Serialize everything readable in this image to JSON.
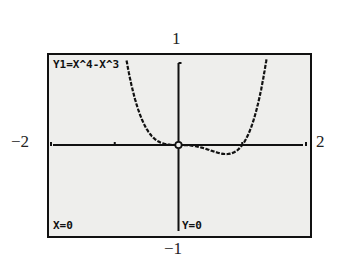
{
  "screen": {
    "equation_label": "Y1=X^4-X^3",
    "trace_x_label": "X=0",
    "trace_y_label": "Y=0"
  },
  "window": {
    "xmin_label": "−2",
    "xmax_label": "2",
    "ymin_label": "−1",
    "ymax_label": "1"
  },
  "colors": {
    "screen_bg": "#eeeeec",
    "ink": "#111111"
  },
  "chart_data": {
    "type": "line",
    "title": "Y1=X^4-X^3",
    "function": "x^4 - x^3",
    "xlabel": "",
    "ylabel": "",
    "xlim": [
      -2,
      2
    ],
    "ylim": [
      -1,
      1
    ],
    "x_ticks": [
      -2,
      -1,
      0,
      1,
      2
    ],
    "grid": false,
    "trace_point": {
      "x": 0,
      "y": 0
    },
    "series": [
      {
        "name": "Y1",
        "x": [
          -0.75,
          -0.7,
          -0.6,
          -0.5,
          -0.4,
          -0.3,
          -0.2,
          -0.1,
          0,
          0.1,
          0.2,
          0.3,
          0.4,
          0.5,
          0.6,
          0.7,
          0.75,
          0.8,
          0.9,
          1.0,
          1.1,
          1.2,
          1.3,
          1.36
        ],
        "values": [
          0.738,
          0.583,
          0.346,
          0.188,
          0.09,
          0.035,
          0.01,
          0.001,
          0,
          -0.001,
          -0.006,
          -0.019,
          -0.038,
          -0.063,
          -0.086,
          -0.103,
          -0.105,
          -0.102,
          -0.073,
          0,
          0.133,
          0.346,
          0.659,
          0.907
        ]
      }
    ]
  }
}
